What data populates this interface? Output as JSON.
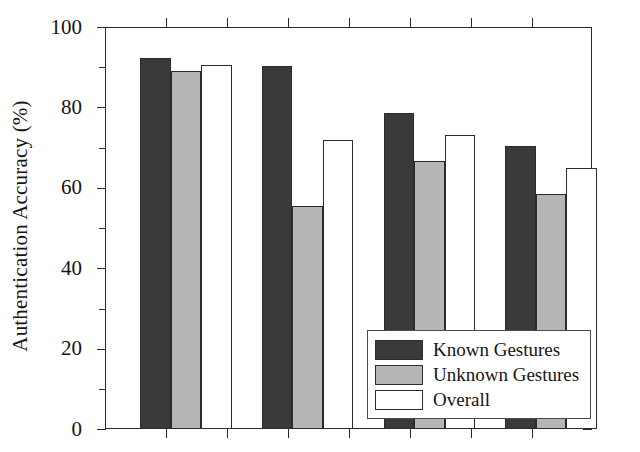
{
  "chart_data": {
    "type": "bar",
    "title": "",
    "subtitle": "",
    "xlabel": "",
    "ylabel": "Authentication Accuracy (%)",
    "ylim": [
      0,
      100
    ],
    "xlim": [
      0,
      4
    ],
    "y_ticks": [
      0,
      20,
      40,
      60,
      80,
      100
    ],
    "y_tick_labels": [
      "0",
      "20",
      "40",
      "60",
      "80",
      "100"
    ],
    "y_minor_ticks": [
      10,
      30,
      50,
      70,
      90
    ],
    "x_tick_labels": [
      "",
      "",
      "",
      ""
    ],
    "grid": false,
    "legend_position": "lower right",
    "categories": [
      "1",
      "2",
      "3",
      "4"
    ],
    "series": [
      {
        "name": "Known Gestures",
        "color": "#3a3a3a",
        "values": [
          92.2,
          90.4,
          78.6,
          70.4
        ]
      },
      {
        "name": "Unknown Gestures",
        "color": "#b6b6b6",
        "values": [
          89.1,
          55.6,
          66.6,
          58.5
        ]
      },
      {
        "name": "Overall",
        "color": "#ffffff",
        "values": [
          90.6,
          71.9,
          73.2,
          65.0
        ]
      }
    ],
    "annotations": []
  },
  "legend": {
    "entries": [
      {
        "label": "Known Gestures",
        "swatch": "#3a3a3a"
      },
      {
        "label": "Unknown Gestures",
        "swatch": "#b6b6b6"
      },
      {
        "label": "Overall",
        "swatch": "#ffffff"
      }
    ]
  },
  "axes": {
    "y_title": "Authentication Accuracy (%)",
    "labels": {
      "y0": "0",
      "y20": "20",
      "y40": "40",
      "y60": "60",
      "y80": "80",
      "y100": "100"
    }
  }
}
